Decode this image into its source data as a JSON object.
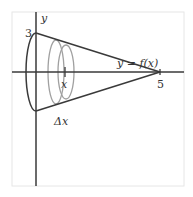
{
  "diagram": {
    "type": "solid-of-revolution",
    "labels": {
      "y_axis": "y",
      "y_intercept": "3",
      "function": "y = f(x)",
      "x_intercept": "5",
      "x_marker": "x",
      "delta": "Δx"
    },
    "colors": {
      "axes": "#3a3a3a",
      "curve": "#3a3a3a",
      "disks": "#9a9a9a",
      "frame": "#e6e6e6",
      "text": "#333333"
    }
  }
}
